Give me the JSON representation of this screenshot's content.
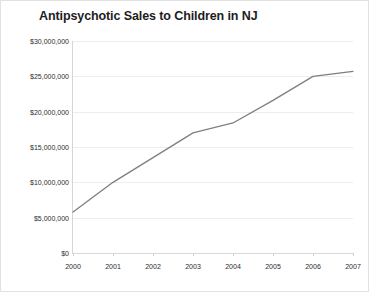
{
  "chart_data": {
    "type": "line",
    "title": "Antipsychotic Sales to Children in NJ",
    "xlabel": "",
    "ylabel": "",
    "categories": [
      "2000",
      "2001",
      "2002",
      "2003",
      "2004",
      "2005",
      "2006",
      "2007"
    ],
    "x": [
      2000,
      2001,
      2002,
      2003,
      2004,
      2005,
      2006,
      2007
    ],
    "values": [
      5800000,
      10000000,
      13500000,
      17000000,
      18400000,
      21600000,
      25000000,
      25700000
    ],
    "series": [
      {
        "name": "Antipsychotic Sales",
        "values": [
          5800000,
          10000000,
          13500000,
          17000000,
          18400000,
          21600000,
          25000000,
          25700000
        ]
      }
    ],
    "ylim": [
      0,
      30000000
    ],
    "ytick_values": [
      0,
      5000000,
      10000000,
      15000000,
      20000000,
      25000000,
      30000000
    ],
    "ytick_labels": [
      "$0",
      "$5,000,000",
      "$10,000,000",
      "$15,000,000",
      "$20,000,000",
      "$25,000,000",
      "$30,000,000"
    ],
    "grid": true,
    "legend": false,
    "legend_position": "none",
    "markers": false,
    "line_color": "#7f7f7f",
    "grid_color": "#ededed",
    "axis_color": "#d6d6d6",
    "title_color": "#1d1d1d",
    "background_color": "#ffffff"
  }
}
